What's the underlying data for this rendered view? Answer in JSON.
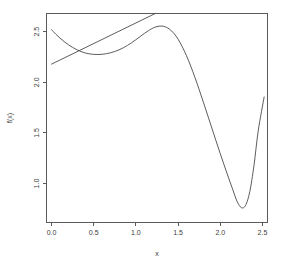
{
  "chart_data": {
    "type": "line",
    "title": "",
    "subtitle": "",
    "xlabel": "x",
    "ylabel": "f(x)",
    "xlim": [
      -0.06,
      2.56
    ],
    "ylim": [
      0.62,
      2.68
    ],
    "grid": false,
    "legend": "none",
    "xticks": [
      "0.0",
      "0.5",
      "1.0",
      "1.5",
      "2.0",
      "2.5"
    ],
    "xtick_values": [
      0.0,
      0.5,
      1.0,
      1.5,
      2.0,
      2.5
    ],
    "yticks": [
      "2.5",
      "2.0",
      "1.5",
      "1.0"
    ],
    "ytick_values": [
      2.5,
      2.0,
      1.5,
      1.0
    ],
    "series": [
      {
        "name": "f(x)",
        "x": [
          0.0,
          0.05,
          0.1,
          0.15,
          0.2,
          0.25,
          0.3,
          0.35,
          0.4,
          0.45,
          0.5,
          0.55,
          0.6,
          0.65,
          0.7,
          0.75,
          0.8,
          0.85,
          0.9,
          0.95,
          1.0,
          1.05,
          1.1,
          1.15,
          1.2,
          1.25,
          1.3,
          1.35,
          1.4,
          1.45,
          1.5,
          1.55,
          1.6,
          1.65,
          1.7,
          1.75,
          1.8,
          1.85,
          1.9,
          1.95,
          2.0,
          2.05,
          2.1,
          2.15,
          2.2,
          2.25,
          2.3,
          2.35,
          2.4,
          2.45,
          2.52
        ],
        "y": [
          2.52,
          2.476,
          2.437,
          2.402,
          2.371,
          2.345,
          2.322,
          2.304,
          2.29,
          2.281,
          2.276,
          2.275,
          2.277,
          2.283,
          2.292,
          2.305,
          2.321,
          2.341,
          2.365,
          2.392,
          2.421,
          2.452,
          2.483,
          2.511,
          2.535,
          2.551,
          2.556,
          2.548,
          2.524,
          2.484,
          2.426,
          2.351,
          2.262,
          2.16,
          2.048,
          1.928,
          1.803,
          1.676,
          1.548,
          1.421,
          1.296,
          1.173,
          1.053,
          0.936,
          0.822,
          0.762,
          0.784,
          0.92,
          1.18,
          1.52,
          1.855
        ]
      },
      {
        "name": "line",
        "x": [
          0.0,
          1.23
        ],
        "y": [
          2.18,
          2.68
        ]
      }
    ]
  }
}
